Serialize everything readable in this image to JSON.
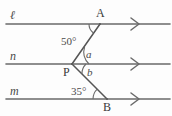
{
  "figure": {
    "type": "geometry-diagram",
    "background_color": "#fdfdfd",
    "stroke_color": "#4a4a4a",
    "text_color": "#3c3c3c"
  },
  "lines": [
    {
      "id": "l",
      "label": "ℓ",
      "label_x": 10,
      "label_y": 9,
      "y": 24,
      "x_start": 6,
      "x_end": 170,
      "arrow_x": 136
    },
    {
      "id": "n",
      "label": "n",
      "label_x": 10,
      "label_y": 50,
      "y": 64,
      "x_start": 6,
      "x_end": 170,
      "arrow_x": 136
    },
    {
      "id": "m",
      "label": "m",
      "label_x": 10,
      "label_y": 85,
      "y": 99,
      "x_start": 6,
      "x_end": 170,
      "arrow_x": 136
    }
  ],
  "points": [
    {
      "id": "A",
      "label": "A",
      "x": 100,
      "y": 24,
      "label_x": 96,
      "label_y": 7
    },
    {
      "id": "P",
      "label": "P",
      "x": 72,
      "y": 64,
      "label_x": 63,
      "label_y": 66
    },
    {
      "id": "B",
      "label": "B",
      "x": 107,
      "y": 99,
      "label_x": 103,
      "label_y": 101
    }
  ],
  "segments": [
    {
      "from": "A",
      "to": "P"
    },
    {
      "from": "P",
      "to": "B"
    }
  ],
  "angles": [
    {
      "id": "angle-A",
      "label": "50°",
      "value": 50,
      "unit": "degrees",
      "vertex": "A",
      "label_x": 61,
      "label_y": 36
    },
    {
      "id": "angle-a",
      "label": "a",
      "value": null,
      "unit": "unknown",
      "vertex": "P",
      "label_x": 86,
      "label_y": 49
    },
    {
      "id": "angle-b",
      "label": "b",
      "value": null,
      "unit": "unknown",
      "vertex": "P",
      "label_x": 87,
      "label_y": 67
    },
    {
      "id": "angle-B",
      "label": "35°",
      "value": 35,
      "unit": "degrees",
      "vertex": "B",
      "label_x": 71,
      "label_y": 86
    }
  ]
}
